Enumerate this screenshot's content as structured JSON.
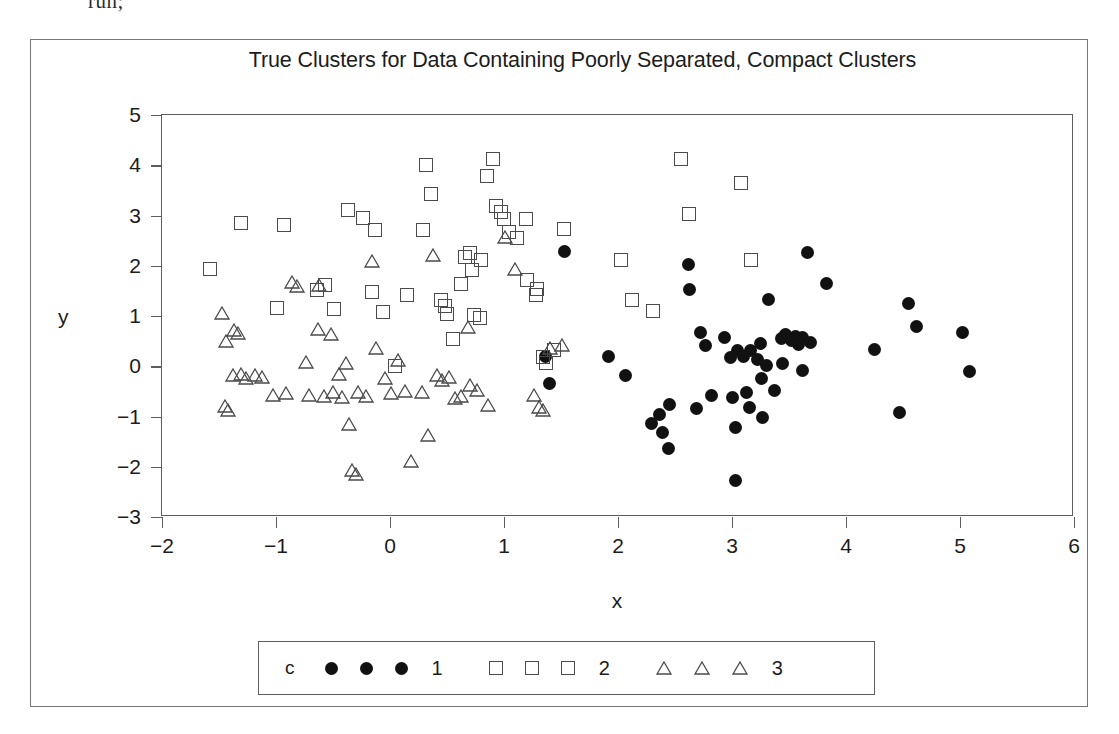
{
  "code_fragment": "run;",
  "chart_data": {
    "type": "scatter",
    "title": "True Clusters for Data Containing Poorly Separated, Compact Clusters",
    "xlabel": "x",
    "ylabel": "y",
    "xlim": [
      -2,
      6
    ],
    "ylim": [
      -3,
      5
    ],
    "xticks": [
      -2,
      -1,
      0,
      1,
      2,
      3,
      4,
      5,
      6
    ],
    "yticks": [
      -3,
      -2,
      -1,
      0,
      1,
      2,
      3,
      4,
      5
    ],
    "xticklabels": [
      "-2",
      "-1",
      "0",
      "1",
      "2",
      "3",
      "4",
      "5",
      "6"
    ],
    "yticklabels": [
      "-3",
      "-2",
      "-1",
      "0",
      "1",
      "2",
      "3",
      "4",
      "5"
    ],
    "grid": false,
    "legend_position": "below",
    "legend_title": "c",
    "series": [
      {
        "name": "1",
        "marker": "filled-circle",
        "color": "#111111",
        "points": [
          [
            1.53,
            2.28
          ],
          [
            2.62,
            2.02
          ],
          [
            2.63,
            1.53
          ],
          [
            3.66,
            2.26
          ],
          [
            3.83,
            1.64
          ],
          [
            3.32,
            1.33
          ],
          [
            2.93,
            0.58
          ],
          [
            3.25,
            0.46
          ],
          [
            3.43,
            0.56
          ],
          [
            3.47,
            0.63
          ],
          [
            3.52,
            0.52
          ],
          [
            3.56,
            0.6
          ],
          [
            3.58,
            0.43
          ],
          [
            3.62,
            0.57
          ],
          [
            3.1,
            0.2
          ],
          [
            3.16,
            0.32
          ],
          [
            3.22,
            0.13
          ],
          [
            3.05,
            0.31
          ],
          [
            2.99,
            0.18
          ],
          [
            3.3,
            0.02
          ],
          [
            3.44,
            0.05
          ],
          [
            3.62,
            -0.09
          ],
          [
            4.25,
            0.33
          ],
          [
            4.62,
            0.79
          ],
          [
            4.55,
            1.24
          ],
          [
            5.02,
            0.67
          ],
          [
            5.08,
            -0.11
          ],
          [
            3.26,
            -0.25
          ],
          [
            3.37,
            -0.48
          ],
          [
            3.13,
            -0.53
          ],
          [
            3.0,
            -0.62
          ],
          [
            2.82,
            -0.58
          ],
          [
            2.69,
            -0.85
          ],
          [
            2.45,
            -0.76
          ],
          [
            2.36,
            -0.97
          ],
          [
            2.29,
            -1.14
          ],
          [
            2.39,
            -1.31
          ],
          [
            2.44,
            -1.63
          ],
          [
            3.03,
            -1.22
          ],
          [
            3.15,
            -0.83
          ],
          [
            3.27,
            -1.02
          ],
          [
            3.03,
            -2.28
          ],
          [
            2.77,
            0.42
          ],
          [
            1.92,
            0.2
          ],
          [
            2.07,
            -0.19
          ],
          [
            1.36,
            0.2
          ],
          [
            1.4,
            -0.34
          ],
          [
            4.47,
            -0.92
          ],
          [
            2.72,
            0.68
          ],
          [
            3.69,
            0.48
          ]
        ]
      },
      {
        "name": "2",
        "marker": "open-square",
        "color": "#4a4a4a",
        "points": [
          [
            -1.58,
            1.93
          ],
          [
            -1.31,
            2.86
          ],
          [
            -0.93,
            2.81
          ],
          [
            -0.99,
            1.16
          ],
          [
            -0.64,
            1.52
          ],
          [
            -0.57,
            1.61
          ],
          [
            -0.49,
            1.13
          ],
          [
            -0.37,
            3.1
          ],
          [
            -0.24,
            2.96
          ],
          [
            -0.16,
            1.48
          ],
          [
            -0.13,
            2.71
          ],
          [
            0.04,
            0.01
          ],
          [
            0.29,
            2.72
          ],
          [
            0.32,
            4.01
          ],
          [
            0.36,
            3.43
          ],
          [
            0.45,
            1.32
          ],
          [
            0.48,
            1.2
          ],
          [
            0.55,
            0.55
          ],
          [
            0.62,
            1.63
          ],
          [
            0.66,
            2.18
          ],
          [
            0.7,
            2.26
          ],
          [
            0.74,
            1.01
          ],
          [
            0.79,
            0.96
          ],
          [
            0.85,
            3.79
          ],
          [
            0.9,
            4.12
          ],
          [
            0.93,
            3.19
          ],
          [
            0.97,
            3.06
          ],
          [
            1.0,
            2.93
          ],
          [
            1.04,
            2.67
          ],
          [
            1.11,
            2.55
          ],
          [
            1.19,
            2.94
          ],
          [
            1.2,
            1.71
          ],
          [
            1.28,
            1.41
          ],
          [
            1.34,
            0.18
          ],
          [
            1.37,
            0.07
          ],
          [
            1.44,
            0.32
          ],
          [
            1.53,
            2.73
          ],
          [
            2.03,
            2.12
          ],
          [
            2.12,
            1.31
          ],
          [
            2.31,
            1.09
          ],
          [
            2.55,
            4.13
          ],
          [
            2.62,
            3.03
          ],
          [
            3.08,
            3.64
          ],
          [
            3.17,
            2.12
          ],
          [
            0.8,
            2.12
          ],
          [
            0.72,
            1.92
          ],
          [
            -0.06,
            1.08
          ],
          [
            0.15,
            1.42
          ],
          [
            0.5,
            1.04
          ],
          [
            1.29,
            1.53
          ]
        ]
      },
      {
        "name": "3",
        "marker": "open-triangle",
        "color": "#4a4a4a",
        "points": [
          [
            -1.47,
            0.92
          ],
          [
            -1.44,
            0.36
          ],
          [
            -1.37,
            0.59
          ],
          [
            -1.33,
            0.52
          ],
          [
            -1.38,
            -0.31
          ],
          [
            -1.31,
            -0.3
          ],
          [
            -1.26,
            -0.37
          ],
          [
            -1.45,
            -0.93
          ],
          [
            -1.42,
            -1.0
          ],
          [
            -1.18,
            -0.31
          ],
          [
            -1.12,
            -0.36
          ],
          [
            -1.03,
            -0.72
          ],
          [
            -0.91,
            -0.68
          ],
          [
            -0.86,
            1.53
          ],
          [
            -0.82,
            1.45
          ],
          [
            -0.74,
            -0.05
          ],
          [
            -0.71,
            -0.72
          ],
          [
            -0.63,
            0.6
          ],
          [
            -0.58,
            -0.73
          ],
          [
            -0.52,
            0.51
          ],
          [
            -0.5,
            -0.66
          ],
          [
            -0.45,
            -0.29
          ],
          [
            -0.42,
            -0.76
          ],
          [
            -0.39,
            -0.08
          ],
          [
            -0.36,
            -1.29
          ],
          [
            -0.33,
            -2.21
          ],
          [
            -0.3,
            -2.29
          ],
          [
            -0.28,
            -0.65
          ],
          [
            -0.21,
            -0.74
          ],
          [
            -0.16,
            1.95
          ],
          [
            -0.12,
            0.23
          ],
          [
            -0.04,
            -0.37
          ],
          [
            0.01,
            -0.68
          ],
          [
            0.07,
            -0.02
          ],
          [
            0.13,
            -0.63
          ],
          [
            0.18,
            -2.03
          ],
          [
            0.28,
            -0.66
          ],
          [
            0.33,
            -1.5
          ],
          [
            0.38,
            2.08
          ],
          [
            0.41,
            -0.31
          ],
          [
            0.46,
            -0.41
          ],
          [
            0.52,
            -0.35
          ],
          [
            0.57,
            -0.78
          ],
          [
            0.62,
            -0.74
          ],
          [
            0.68,
            0.65
          ],
          [
            0.7,
            -0.51
          ],
          [
            0.76,
            -0.61
          ],
          [
            0.86,
            -0.92
          ],
          [
            1.01,
            2.44
          ],
          [
            1.1,
            1.8
          ],
          [
            1.26,
            -0.72
          ],
          [
            1.31,
            -0.95
          ],
          [
            1.34,
            -1.0
          ],
          [
            1.4,
            0.22
          ],
          [
            1.51,
            0.28
          ],
          [
            -0.62,
            1.48
          ]
        ]
      }
    ]
  }
}
